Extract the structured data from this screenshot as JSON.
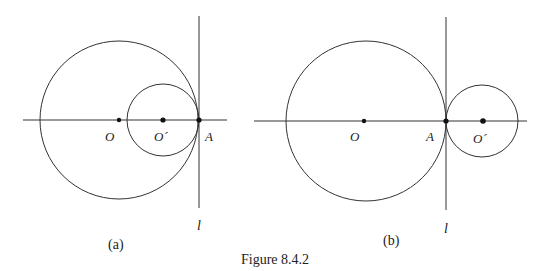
{
  "figure": {
    "caption": "Figure 8.4.2",
    "stroke_color": "#333333",
    "panels": [
      {
        "id": "a",
        "label": "(a)",
        "axis": {
          "x1": 23,
          "x2": 227,
          "y": 120
        },
        "tangent_line": {
          "x": 199,
          "y1": 16,
          "y2": 208,
          "label": "l"
        },
        "big_circle": {
          "cx": 119,
          "cy": 120,
          "r": 79,
          "center_label": "O"
        },
        "small_circle": {
          "cx": 163,
          "cy": 120,
          "r": 36,
          "center_label": "O´"
        },
        "tangent_point": {
          "x": 199,
          "y": 120,
          "label": "A"
        },
        "relation": "internally tangent"
      },
      {
        "id": "b",
        "label": "(b)",
        "axis": {
          "x1": 254,
          "x2": 527,
          "y": 121
        },
        "tangent_line": {
          "x": 446,
          "y1": 17,
          "y2": 210,
          "label": "l"
        },
        "big_circle": {
          "cx": 366,
          "cy": 121,
          "r": 80,
          "center_label": "O"
        },
        "small_circle": {
          "cx": 482,
          "cy": 121,
          "r": 36,
          "center_label": "O´"
        },
        "tangent_point": {
          "x": 446,
          "y": 121,
          "label": "A"
        },
        "relation": "externally tangent"
      }
    ]
  }
}
